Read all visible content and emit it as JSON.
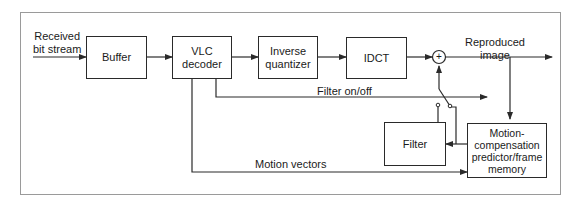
{
  "diagram": {
    "input_label": [
      "Received",
      "bit stream"
    ],
    "output_label": [
      "Reproduced",
      "image"
    ],
    "blocks": {
      "buffer": "Buffer",
      "vlc_decoder": [
        "VLC",
        "decoder"
      ],
      "inverse_quantizer": [
        "Inverse",
        "quantizer"
      ],
      "idct": "IDCT",
      "filter": "Filter",
      "mc_predictor": [
        "Motion-",
        "compensation",
        "predictor/frame",
        "memory"
      ]
    },
    "adder_symbol": "+",
    "signals": {
      "filter_on_off": "Filter on/off",
      "motion_vectors": "Motion vectors"
    },
    "colors": {
      "line": "#2a2a2a",
      "frame": "#9a9a9a"
    }
  }
}
